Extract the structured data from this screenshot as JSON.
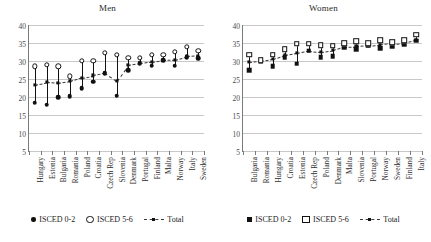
{
  "figure": {
    "panels": [
      {
        "id": "men",
        "title": "Men",
        "legend": [
          {
            "name": "ISCED 0-2",
            "marker": "circle-f"
          },
          {
            "name": "ISCED 5-6",
            "marker": "circle-o"
          },
          {
            "name": "Total",
            "marker": "total"
          }
        ]
      },
      {
        "id": "women",
        "title": "Women",
        "legend": [
          {
            "name": "ISCED 0-2",
            "marker": "square-f"
          },
          {
            "name": "ISCED 5-6",
            "marker": "square-o"
          },
          {
            "name": "Total",
            "marker": "total"
          }
        ]
      }
    ]
  },
  "chart_data": [
    {
      "type": "scatter",
      "title": "Men",
      "xlabel": "",
      "ylabel": "",
      "ylim": [
        5,
        40
      ],
      "yticks": [
        5,
        10,
        15,
        20,
        25,
        30,
        35,
        40
      ],
      "grid": true,
      "legend_position": "bottom",
      "categories": [
        "Hungary",
        "Estonia",
        "Bulgaria",
        "Romania",
        "Poland",
        "Croatia",
        "Czech Rep",
        "Slovenia",
        "Denmark",
        "Portugal",
        "Finland",
        "Malta",
        "Norway",
        "Italy",
        "Sweden"
      ],
      "series": [
        {
          "name": "ISCED 0-2",
          "marker": "circle-f",
          "values": [
            18.4,
            17.9,
            19.9,
            20.3,
            22.4,
            24.3,
            26.6,
            20.4,
            27.4,
            29.4,
            28.7,
            30.3,
            28.7,
            31.0,
            30.7
          ]
        },
        {
          "name": "ISCED 5-6",
          "marker": "circle-o",
          "values": [
            28.5,
            29.0,
            28.5,
            25.8,
            30.1,
            30.0,
            32.2,
            31.7,
            30.9,
            30.9,
            31.8,
            31.8,
            32.5,
            33.9,
            32.8
          ]
        },
        {
          "name": "Total",
          "marker": "total",
          "values": [
            23.4,
            24.1,
            23.9,
            24.4,
            25.4,
            26.0,
            26.6,
            24.4,
            28.9,
            29.4,
            29.8,
            30.3,
            30.4,
            31.3,
            31.5
          ]
        }
      ]
    },
    {
      "type": "scatter",
      "title": "Women",
      "xlabel": "",
      "ylabel": "",
      "ylim": [
        5,
        40
      ],
      "yticks": [
        5,
        10,
        15,
        20,
        25,
        30,
        35,
        40
      ],
      "grid": true,
      "legend_position": "bottom",
      "categories": [
        "Bulgaria",
        "Romania",
        "Hungary",
        "Croatia",
        "Estonia",
        "Czech Rep",
        "Poland",
        "Denmark",
        "Malta",
        "Slovenia",
        "Portugal",
        "Norway",
        "Sweden",
        "Finland",
        "Italy"
      ],
      "series": [
        {
          "name": "ISCED 0-2",
          "marker": "square-f",
          "values": [
            27.4,
            29.8,
            28.5,
            31.0,
            29.3,
            32.9,
            31.1,
            31.3,
            33.9,
            33.2,
            34.2,
            33.5,
            34.1,
            34.6,
            35.6
          ]
        },
        {
          "name": "ISCED 5-6",
          "marker": "square-o",
          "values": [
            31.7,
            30.2,
            31.7,
            33.3,
            34.8,
            34.8,
            34.4,
            34.2,
            35.0,
            35.5,
            34.9,
            35.8,
            35.2,
            35.8,
            37.3
          ]
        },
        {
          "name": "Total",
          "marker": "total",
          "values": [
            29.7,
            30.0,
            30.6,
            31.6,
            32.2,
            32.9,
            32.6,
            33.0,
            34.0,
            34.1,
            34.3,
            34.6,
            34.8,
            35.0,
            35.9
          ]
        }
      ]
    }
  ]
}
